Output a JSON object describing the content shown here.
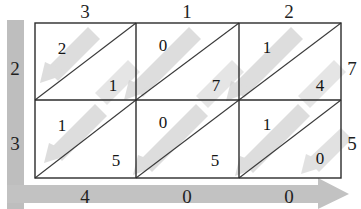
{
  "figure": {
    "kind": "transportation-tableau-grid",
    "rows": 2,
    "cols": 3,
    "colors": {
      "grid_line": "#2b2b2b",
      "diagonal_line": "#3a3a3a",
      "arrow_band": "#c9c9c9",
      "arrow_band_light": "#d8d8d8",
      "axis_band": "#bdbdbd",
      "text": "#1a1a1a",
      "background": "#ffffff"
    }
  },
  "top_labels": [
    "3",
    "1",
    "2"
  ],
  "left_labels": [
    "2",
    "3"
  ],
  "right_labels": [
    "7",
    "5"
  ],
  "bottom_labels": [
    "4",
    "0",
    "0"
  ],
  "cells": [
    {
      "row": 0,
      "col": 0,
      "upper_left": "2",
      "lower_right": "1",
      "arrow_icon": "diagonal-arrow-down-left"
    },
    {
      "row": 0,
      "col": 1,
      "upper_left": "0",
      "lower_right": "7",
      "arrow_icon": "diagonal-arrow-down-left"
    },
    {
      "row": 0,
      "col": 2,
      "upper_left": "1",
      "lower_right": "4",
      "arrow_icon": "diagonal-arrow-down-left"
    },
    {
      "row": 1,
      "col": 0,
      "upper_left": "1",
      "lower_right": "5",
      "arrow_icon": "diagonal-arrow-down-left"
    },
    {
      "row": 1,
      "col": 1,
      "upper_left": "0",
      "lower_right": "5",
      "arrow_icon": "diagonal-arrow-down-left"
    },
    {
      "row": 1,
      "col": 2,
      "upper_left": "1",
      "lower_right": "0",
      "arrow_icon": "diagonal-arrow-down-left"
    }
  ],
  "axes": {
    "vertical_band_icon": "vertical-arrow-band",
    "horizontal_band_icon": "horizontal-arrow-right"
  }
}
